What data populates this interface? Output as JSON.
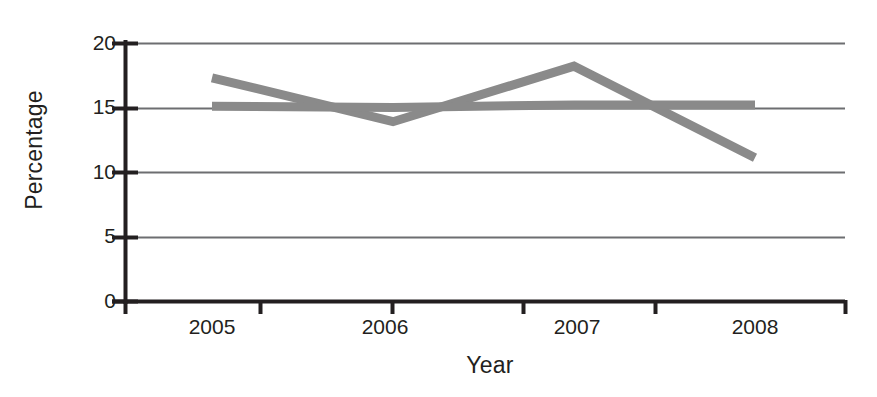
{
  "chart_data": {
    "type": "line",
    "title": "",
    "xlabel": "Year",
    "ylabel": "Percentage",
    "categories": [
      "2005",
      "2006",
      "2007",
      "2008"
    ],
    "x": [
      2005,
      2006,
      2007,
      2008
    ],
    "series": [
      {
        "name": "series-1",
        "values": [
          17.3,
          13.9,
          18.2,
          11.1
        ],
        "color": "#8a8a8a"
      },
      {
        "name": "series-2",
        "values": [
          15.1,
          15.0,
          15.2,
          15.2
        ],
        "color": "#8a8a8a"
      }
    ],
    "ylim": [
      0,
      20
    ],
    "yticks": [
      0,
      5,
      10,
      15,
      20
    ],
    "ytick_labels": [
      "0",
      "5",
      "10",
      "15",
      "20"
    ],
    "xtick_labels": [
      "2005",
      "2006",
      "2007",
      "2008"
    ],
    "grid": true,
    "grid_axis": "y",
    "legend": "none",
    "line_width_px": 9,
    "colors": {
      "line": "#8a8a8a",
      "grid": "#6d6e71",
      "axis": "#231f20",
      "text": "#231f20",
      "background": "#ffffff"
    }
  },
  "axes": {
    "y_title": "Percentage",
    "x_title": "Year",
    "y_ticks": [
      {
        "label": "20",
        "value": 20
      },
      {
        "label": "15",
        "value": 15
      },
      {
        "label": "10",
        "value": 10
      },
      {
        "label": "5",
        "value": 5
      },
      {
        "label": "0",
        "value": 0
      }
    ],
    "x_ticks": [
      {
        "label": "2005"
      },
      {
        "label": "2006"
      },
      {
        "label": "2007"
      },
      {
        "label": "2008"
      }
    ]
  }
}
